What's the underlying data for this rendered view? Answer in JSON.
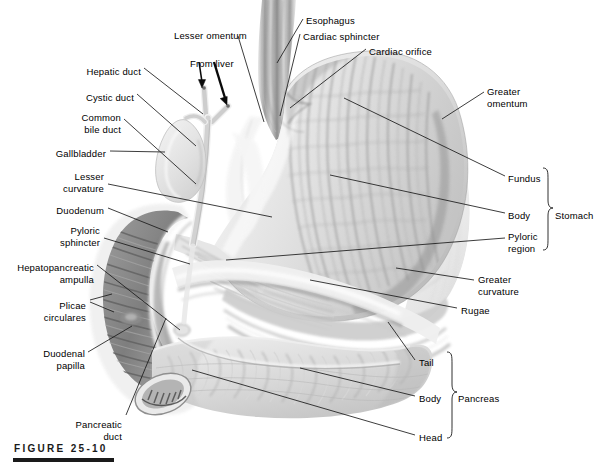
{
  "figure": {
    "caption": "FIGURE 25-10"
  },
  "colors": {
    "background": "#ffffff",
    "ink": "#000000",
    "leader": "#1a1a1a",
    "organ_light": "#e9e9e9",
    "organ_mid": "#c2c2c2",
    "organ_dark": "#8f8f8f",
    "organ_darkest": "#6a6a6a",
    "caption": "#1a1a1a"
  },
  "labels": [
    {
      "id": "hepatic-duct",
      "text": "Hepatic duct",
      "x": 141,
      "y": 66,
      "align": "right"
    },
    {
      "id": "cystic-duct",
      "text": "Cystic duct",
      "x": 134,
      "y": 92,
      "align": "right"
    },
    {
      "id": "common-bile-duct",
      "text": "Common\nbile duct",
      "x": 121,
      "y": 112,
      "align": "right"
    },
    {
      "id": "gallbladder",
      "text": "Gallbladder",
      "x": 106,
      "y": 148,
      "align": "right"
    },
    {
      "id": "lesser-curvature",
      "text": "Lesser\ncurvature",
      "x": 104,
      "y": 171,
      "align": "right"
    },
    {
      "id": "duodenum",
      "text": "Duodenum",
      "x": 104,
      "y": 205,
      "align": "right"
    },
    {
      "id": "pyloric-sphincter",
      "text": "Pyloric\nsphincter",
      "x": 100,
      "y": 225,
      "align": "right"
    },
    {
      "id": "hepatopancreatic-ampulla",
      "text": "Hepatopancreatic\nampulla",
      "x": 94,
      "y": 262,
      "align": "right"
    },
    {
      "id": "plicae-circulares",
      "text": "Plicae\ncirculares",
      "x": 86,
      "y": 300,
      "align": "right"
    },
    {
      "id": "duodenal-papilla",
      "text": "Duodenal\npapilla",
      "x": 85,
      "y": 348,
      "align": "right"
    },
    {
      "id": "pancreatic-duct",
      "text": "Pancreatic\nduct",
      "x": 122,
      "y": 419,
      "align": "right"
    },
    {
      "id": "lesser-omentum",
      "text": "Lesser omentum",
      "x": 174,
      "y": 30,
      "align": "left"
    },
    {
      "id": "from-liver",
      "text": "From liver",
      "x": 190,
      "y": 58,
      "align": "left"
    },
    {
      "id": "esophagus",
      "text": "Esophagus",
      "x": 306,
      "y": 15,
      "align": "left"
    },
    {
      "id": "cardiac-sphincter",
      "text": "Cardiac sphincter",
      "x": 303,
      "y": 31,
      "align": "left"
    },
    {
      "id": "cardiac-orifice",
      "text": "Cardiac orifice",
      "x": 369,
      "y": 46,
      "align": "left"
    },
    {
      "id": "greater-omentum",
      "text": "Greater\nomentum",
      "x": 487,
      "y": 86,
      "align": "left"
    },
    {
      "id": "fundus",
      "text": "Fundus",
      "x": 508,
      "y": 173,
      "align": "left"
    },
    {
      "id": "body-stomach",
      "text": "Body",
      "x": 508,
      "y": 210,
      "align": "left"
    },
    {
      "id": "pyloric-region",
      "text": "Pyloric\nregion",
      "x": 508,
      "y": 231,
      "align": "left"
    },
    {
      "id": "stomach",
      "text": "Stomach",
      "x": 555,
      "y": 210,
      "align": "left"
    },
    {
      "id": "greater-curvature",
      "text": "Greater\ncurvature",
      "x": 478,
      "y": 274,
      "align": "left"
    },
    {
      "id": "rugae",
      "text": "Rugae",
      "x": 461,
      "y": 305,
      "align": "left"
    },
    {
      "id": "tail",
      "text": "Tail",
      "x": 419,
      "y": 357,
      "align": "left"
    },
    {
      "id": "body-pancreas",
      "text": "Body",
      "x": 419,
      "y": 393,
      "align": "left"
    },
    {
      "id": "head",
      "text": "Head",
      "x": 419,
      "y": 432,
      "align": "left"
    },
    {
      "id": "pancreas",
      "text": "Pancreas",
      "x": 458,
      "y": 393,
      "align": "left"
    }
  ],
  "braces": [
    {
      "id": "stomach-brace",
      "label": "Stomach",
      "top": 168,
      "bottom": 248,
      "x": 545
    },
    {
      "id": "pancreas-brace",
      "label": "Pancreas",
      "top": 352,
      "bottom": 437,
      "x": 449
    }
  ],
  "arrows": [
    {
      "id": "from-liver-arrow-left",
      "from_x": 199,
      "from_y": 62,
      "to_x": 203,
      "to_y": 88
    },
    {
      "id": "from-liver-arrow-right",
      "from_x": 215,
      "from_y": 62,
      "to_x": 227,
      "to_y": 105
    }
  ],
  "structures": [
    "esophagus",
    "cardiac sphincter",
    "cardiac orifice",
    "stomach fundus",
    "stomach body",
    "pyloric region",
    "rugae",
    "greater curvature",
    "lesser curvature",
    "greater omentum",
    "lesser omentum",
    "pyloric sphincter",
    "duodenum",
    "plicae circulares",
    "duodenal papilla",
    "hepatopancreatic ampulla",
    "pancreatic duct",
    "pancreas head",
    "pancreas body",
    "pancreas tail",
    "gallbladder",
    "cystic duct",
    "hepatic duct",
    "common bile duct"
  ]
}
